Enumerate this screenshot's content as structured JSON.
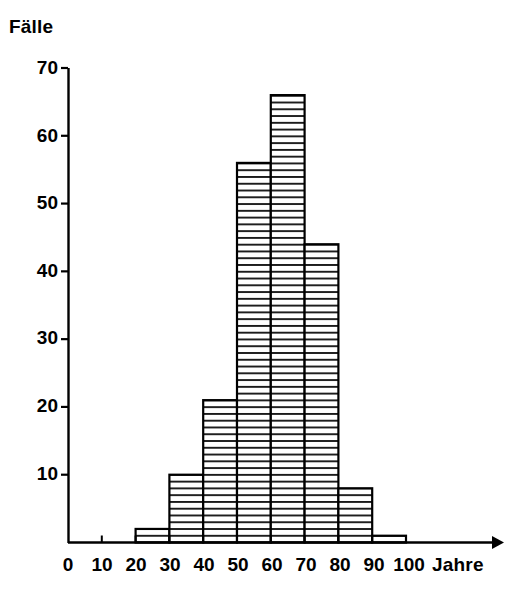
{
  "chart_data": {
    "type": "bar",
    "title": "",
    "subtitle": "",
    "ylabel": "Fälle",
    "xlabel": "Jahre",
    "categories": [
      "0-10",
      "10-20",
      "20-30",
      "30-40",
      "40-50",
      "50-60",
      "60-70",
      "70-80",
      "80-90",
      "90-100"
    ],
    "bin_edges": [
      0,
      10,
      20,
      30,
      40,
      50,
      60,
      70,
      80,
      90,
      100
    ],
    "values": [
      0,
      0,
      2,
      10,
      21,
      56,
      66,
      44,
      8,
      1
    ],
    "x": [
      5,
      15,
      25,
      35,
      45,
      55,
      65,
      75,
      85,
      95
    ],
    "xlim": [
      0,
      100
    ],
    "ylim": [
      0,
      70
    ],
    "xticks": [
      0,
      10,
      20,
      30,
      40,
      50,
      60,
      70,
      80,
      90,
      100
    ],
    "yticks": [
      10,
      20,
      30,
      40,
      50,
      60,
      70
    ],
    "grid": false,
    "legend": null,
    "bar_fill": "horizontal-hatch",
    "bar_stroke": "#000000",
    "axis_color": "#000000",
    "background": "#ffffff"
  },
  "axes": {
    "y_title": "Fälle",
    "x_title": "Jahre",
    "y_tick_labels": [
      "70",
      "60",
      "50",
      "40",
      "30",
      "20",
      "10"
    ],
    "x_tick_labels": [
      "0",
      "10",
      "20",
      "30",
      "40",
      "50",
      "60",
      "70",
      "80",
      "90",
      "100"
    ]
  }
}
